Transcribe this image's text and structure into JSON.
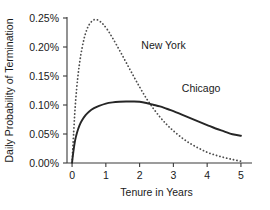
{
  "chart_data": {
    "type": "line",
    "title": "",
    "xlabel": "Tenure in Years",
    "ylabel": "Daily Probability of Termination",
    "xlim": [
      -0.15,
      5.15
    ],
    "ylim": [
      0.0,
      0.25
    ],
    "grid": false,
    "legend_position": "inline-annotations",
    "xticks": [
      "0",
      "1",
      "2",
      "3",
      "4",
      "5"
    ],
    "xtick_values": [
      0,
      1,
      2,
      3,
      4,
      5
    ],
    "yticks": [
      "0.00%",
      "0.05%",
      "0.10%",
      "0.15%",
      "0.20%",
      "0.25%"
    ],
    "ytick_values": [
      0.0,
      0.05,
      0.1,
      0.15,
      0.2,
      0.25
    ],
    "series": [
      {
        "name": "New York",
        "style": "dotted",
        "color": "#4d4d4d",
        "annotation_x": 2.05,
        "annotation_y": 0.196,
        "x": [
          0.0,
          0.05,
          0.1,
          0.17,
          0.25,
          0.35,
          0.45,
          0.55,
          0.65,
          0.76,
          0.9,
          1.05,
          1.2,
          1.4,
          1.6,
          1.8,
          2.0,
          2.2,
          2.4,
          2.6,
          2.8,
          3.0,
          3.25,
          3.5,
          3.75,
          4.0,
          4.25,
          4.5,
          4.75,
          5.0
        ],
        "y": [
          0.0,
          0.055,
          0.103,
          0.148,
          0.183,
          0.213,
          0.232,
          0.242,
          0.247,
          0.2465,
          0.2405,
          0.2295,
          0.2155,
          0.195,
          0.1735,
          0.152,
          0.131,
          0.1115,
          0.0945,
          0.0795,
          0.0665,
          0.0555,
          0.0435,
          0.0335,
          0.0255,
          0.0185,
          0.0135,
          0.0095,
          0.006,
          0.003
        ]
      },
      {
        "name": "Chicago",
        "style": "solid",
        "color": "#262626",
        "annotation_x": 3.25,
        "annotation_y": 0.122,
        "x": [
          0.0,
          0.04,
          0.09,
          0.15,
          0.22,
          0.3,
          0.4,
          0.5,
          0.65,
          0.8,
          1.0,
          1.2,
          1.4,
          1.6,
          1.8,
          2.0,
          2.2,
          2.4,
          2.6,
          2.8,
          3.0,
          3.25,
          3.5,
          3.75,
          4.0,
          4.25,
          4.5,
          4.75,
          5.0
        ],
        "y": [
          0.001,
          0.02,
          0.039,
          0.053,
          0.065,
          0.074,
          0.0825,
          0.0885,
          0.0945,
          0.0985,
          0.1025,
          0.1045,
          0.1055,
          0.106,
          0.106,
          0.1055,
          0.1035,
          0.1005,
          0.0975,
          0.0935,
          0.0895,
          0.0835,
          0.0775,
          0.0715,
          0.0655,
          0.0595,
          0.0545,
          0.0495,
          0.047
        ]
      }
    ]
  }
}
